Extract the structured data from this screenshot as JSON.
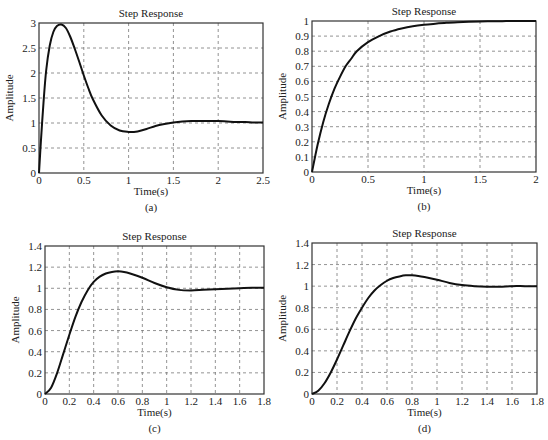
{
  "chart_data": [
    {
      "id": "a",
      "type": "line",
      "title": "Step Response",
      "xlabel": "Time(s)",
      "ylabel": "Amplitude",
      "caption": "(a)",
      "xlim": [
        0,
        2.5
      ],
      "ylim": [
        0,
        3
      ],
      "xticks": [
        0,
        0.5,
        1,
        1.5,
        2,
        2.5
      ],
      "xtick_labels": [
        "0",
        "0.5",
        "1",
        "1.5",
        "2",
        "2.5"
      ],
      "yticks": [
        0,
        0.5,
        1,
        1.5,
        2,
        2.5,
        3
      ],
      "ytick_labels": [
        "0",
        "0.5",
        "1",
        "1.5",
        "2",
        "2.5",
        "3"
      ],
      "grid": true,
      "frame": {
        "left": 39,
        "right": 263,
        "top": 23,
        "bottom": 173
      },
      "series": [
        {
          "name": "step response",
          "x": [
            0,
            0.02,
            0.05,
            0.08,
            0.12,
            0.16,
            0.2,
            0.25,
            0.3,
            0.35,
            0.4,
            0.45,
            0.5,
            0.55,
            0.6,
            0.7,
            0.8,
            0.9,
            1.0,
            1.05,
            1.1,
            1.2,
            1.3,
            1.4,
            1.5,
            1.6,
            1.7,
            1.8,
            1.9,
            2.0,
            2.1,
            2.2,
            2.3,
            2.4,
            2.5
          ],
          "y": [
            0,
            0.6,
            1.4,
            2.05,
            2.55,
            2.82,
            2.94,
            2.97,
            2.9,
            2.72,
            2.48,
            2.22,
            1.95,
            1.7,
            1.48,
            1.15,
            0.95,
            0.85,
            0.82,
            0.82,
            0.83,
            0.88,
            0.94,
            0.98,
            1.01,
            1.03,
            1.04,
            1.04,
            1.04,
            1.04,
            1.03,
            1.02,
            1.02,
            1.01,
            1.01
          ]
        }
      ]
    },
    {
      "id": "b",
      "type": "line",
      "title": "Step Response",
      "xlabel": "Time(s)",
      "ylabel": "Amplitude",
      "caption": "(b)",
      "xlim": [
        0,
        2
      ],
      "ylim": [
        0,
        1
      ],
      "xticks": [
        0,
        0.5,
        1,
        1.5,
        2
      ],
      "xtick_labels": [
        "0",
        "0.5",
        "1",
        "1.5",
        "2"
      ],
      "yticks": [
        0,
        0.1,
        0.2,
        0.3,
        0.4,
        0.5,
        0.6,
        0.7,
        0.8,
        0.9,
        1
      ],
      "ytick_labels": [
        "0",
        "0.1",
        "0.2",
        "0.3",
        "0.4",
        "0.5",
        "0.6",
        "0.7",
        "0.8",
        "0.9",
        "1"
      ],
      "grid": true,
      "frame": {
        "left": 312,
        "right": 536,
        "top": 21,
        "bottom": 172
      },
      "series": [
        {
          "name": "step response",
          "x": [
            0,
            0.05,
            0.1,
            0.15,
            0.2,
            0.25,
            0.3,
            0.35,
            0.4,
            0.5,
            0.6,
            0.7,
            0.8,
            0.9,
            1.0,
            1.1,
            1.2,
            1.3,
            1.4,
            1.5,
            1.6,
            1.7,
            1.8,
            1.9,
            2.0
          ],
          "y": [
            0,
            0.18,
            0.33,
            0.45,
            0.55,
            0.63,
            0.7,
            0.75,
            0.8,
            0.86,
            0.9,
            0.93,
            0.95,
            0.965,
            0.975,
            0.982,
            0.988,
            0.992,
            0.995,
            0.997,
            0.998,
            0.999,
            1.0,
            1.0,
            1.0
          ]
        }
      ]
    },
    {
      "id": "c",
      "type": "line",
      "title": "Step Response",
      "xlabel": "Time(s)",
      "ylabel": "Amplitude",
      "caption": "(c)",
      "xlim": [
        0,
        1.8
      ],
      "ylim": [
        0,
        1.4
      ],
      "xticks": [
        0,
        0.2,
        0.4,
        0.6,
        0.8,
        1,
        1.2,
        1.4,
        1.6,
        1.8
      ],
      "xtick_labels": [
        "0",
        "0.2",
        "0.4",
        "0.6",
        "0.8",
        "1",
        "1.2",
        "1.4",
        "1.6",
        "1.8"
      ],
      "yticks": [
        0,
        0.2,
        0.4,
        0.6,
        0.8,
        1,
        1.2,
        1.4
      ],
      "ytick_labels": [
        "0",
        "0.2",
        "0.4",
        "0.6",
        "0.8",
        "1",
        "1.2",
        "1.4"
      ],
      "grid": true,
      "frame": {
        "left": 45,
        "right": 264,
        "top": 246,
        "bottom": 394
      },
      "series": [
        {
          "name": "step response",
          "x": [
            0,
            0.05,
            0.1,
            0.15,
            0.2,
            0.25,
            0.3,
            0.35,
            0.4,
            0.45,
            0.5,
            0.55,
            0.6,
            0.65,
            0.7,
            0.8,
            0.9,
            1.0,
            1.1,
            1.2,
            1.3,
            1.4,
            1.5,
            1.6,
            1.7,
            1.8
          ],
          "y": [
            0,
            0.06,
            0.2,
            0.38,
            0.56,
            0.73,
            0.87,
            0.98,
            1.06,
            1.11,
            1.14,
            1.155,
            1.16,
            1.155,
            1.14,
            1.1,
            1.05,
            1.01,
            0.985,
            0.98,
            0.985,
            0.99,
            0.995,
            1.0,
            1.005,
            1.005
          ]
        }
      ]
    },
    {
      "id": "d",
      "type": "line",
      "title": "Step Response",
      "xlabel": "Time(s)",
      "ylabel": "Amplitude",
      "caption": "(d)",
      "xlim": [
        0,
        1.8
      ],
      "ylim": [
        0,
        1.4
      ],
      "xticks": [
        0,
        0.2,
        0.4,
        0.6,
        0.8,
        1,
        1.2,
        1.4,
        1.6,
        1.8
      ],
      "xtick_labels": [
        "0",
        "0.2",
        "0.4",
        "0.6",
        "0.8",
        "1",
        "1.2",
        "1.4",
        "1.6",
        "1.8"
      ],
      "yticks": [
        0,
        0.2,
        0.4,
        0.6,
        0.8,
        1,
        1.2,
        1.4
      ],
      "ytick_labels": [
        "0",
        "0.2",
        "0.4",
        "0.6",
        "0.8",
        "1",
        "1.2",
        "1.4"
      ],
      "grid": true,
      "frame": {
        "left": 312,
        "right": 537,
        "top": 243,
        "bottom": 394
      },
      "series": [
        {
          "name": "step response",
          "x": [
            0,
            0.05,
            0.1,
            0.15,
            0.2,
            0.25,
            0.3,
            0.35,
            0.4,
            0.45,
            0.5,
            0.55,
            0.6,
            0.65,
            0.7,
            0.75,
            0.8,
            0.85,
            0.9,
            1.0,
            1.1,
            1.2,
            1.3,
            1.4,
            1.5,
            1.6,
            1.7,
            1.8
          ],
          "y": [
            0,
            0.03,
            0.1,
            0.2,
            0.32,
            0.45,
            0.58,
            0.7,
            0.8,
            0.89,
            0.96,
            1.01,
            1.05,
            1.075,
            1.09,
            1.1,
            1.1,
            1.095,
            1.085,
            1.06,
            1.03,
            1.01,
            1.0,
            0.995,
            0.995,
            1.0,
            1.0,
            1.0
          ]
        }
      ]
    }
  ]
}
